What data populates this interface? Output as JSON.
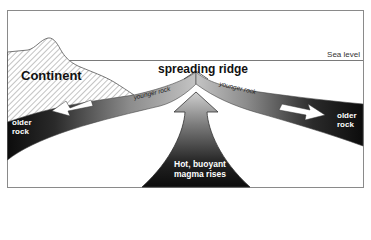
{
  "diagram": {
    "labels": {
      "sea_level": "Sea level",
      "continent": "Continent",
      "spreading_ridge": "spreading ridge",
      "younger_rock_left": "younger rock",
      "younger_rock_right": "younger rock",
      "older_rock_left_line1": "older",
      "older_rock_left_line2": "rock",
      "older_rock_right_line1": "older",
      "older_rock_right_line2": "rock",
      "magma_line1": "Hot, buoyant",
      "magma_line2": "magma rises"
    },
    "colors": {
      "frame": "#8a8a8a",
      "sea_level_line": "#7a7a7a",
      "hatch": "#6a6a6a",
      "slab_dark": "#111111",
      "slab_light": "#bdbdbd",
      "magma_dark": "#111111",
      "magma_light": "#c8c8c8",
      "arrow_fill": "#ffffff"
    },
    "elements": [
      "continent-hatched",
      "sea-level-line",
      "left-plate-slab",
      "right-plate-slab",
      "ridge-apex",
      "magma-upwelling-arrow",
      "left-motion-arrow",
      "right-motion-arrow"
    ]
  }
}
